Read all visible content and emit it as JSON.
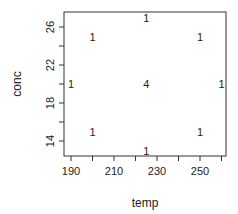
{
  "chart_data": {
    "type": "scatter",
    "title": "",
    "xlabel": "temp",
    "ylabel": "conc",
    "xlim": [
      187,
      263
    ],
    "ylim": [
      12.5,
      27.2
    ],
    "xticks": [
      190,
      200,
      210,
      220,
      230,
      240,
      250,
      260
    ],
    "xtick_labels": [
      "190",
      "",
      "210",
      "",
      "230",
      "",
      "250",
      ""
    ],
    "yticks": [
      14,
      16,
      18,
      20,
      22,
      24,
      26
    ],
    "ytick_labels": [
      "14",
      "",
      "18",
      "",
      "22",
      "",
      "26"
    ],
    "grid": false,
    "legend": null,
    "marker": "count-label",
    "points": [
      {
        "x": 190,
        "y": 20,
        "label": "1"
      },
      {
        "x": 200,
        "y": 25,
        "label": "1"
      },
      {
        "x": 225,
        "y": 27,
        "label": "1"
      },
      {
        "x": 250,
        "y": 25,
        "label": "1"
      },
      {
        "x": 225,
        "y": 20,
        "label": "4"
      },
      {
        "x": 260,
        "y": 20,
        "label": "1"
      },
      {
        "x": 200,
        "y": 15,
        "label": "1"
      },
      {
        "x": 250,
        "y": 15,
        "label": "1"
      },
      {
        "x": 225,
        "y": 13,
        "label": "1"
      }
    ]
  },
  "axes": {
    "xlabel": "temp",
    "ylabel": "conc"
  }
}
